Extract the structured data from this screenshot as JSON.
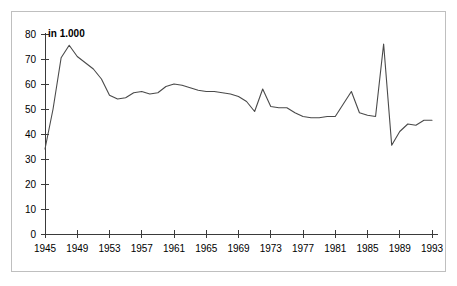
{
  "chart_data": {
    "type": "line",
    "title": "",
    "subtitle": "",
    "unit_label": "in 1.000",
    "xlabel": "",
    "ylabel": "",
    "xlim": [
      1945,
      1993
    ],
    "ylim": [
      0,
      80
    ],
    "y_ticks": [
      0,
      10,
      20,
      30,
      40,
      50,
      60,
      70,
      80
    ],
    "x_ticks": [
      1945,
      1949,
      1953,
      1957,
      1961,
      1965,
      1969,
      1973,
      1977,
      1981,
      1985,
      1989,
      1993
    ],
    "grid": false,
    "legend": null,
    "legend_position": "none",
    "line_color": "#4a4a4a",
    "axis_color": "#3a3a3a",
    "border_color": "#bfbfbf",
    "background_color": "#ffffff",
    "series": [
      {
        "name": "Wert",
        "x": [
          1945,
          1946,
          1947,
          1948,
          1949,
          1950,
          1951,
          1952,
          1953,
          1954,
          1955,
          1956,
          1957,
          1958,
          1959,
          1960,
          1961,
          1962,
          1963,
          1964,
          1965,
          1966,
          1967,
          1968,
          1969,
          1970,
          1971,
          1972,
          1973,
          1974,
          1975,
          1976,
          1977,
          1978,
          1979,
          1980,
          1981,
          1982,
          1983,
          1984,
          1985,
          1986,
          1987,
          1988,
          1989,
          1990,
          1991,
          1992,
          1993
        ],
        "values": [
          34.0,
          50.0,
          70.5,
          75.5,
          71.0,
          68.5,
          66.0,
          62.0,
          55.5,
          54.0,
          54.5,
          56.5,
          57.0,
          56.0,
          56.5,
          59.0,
          60.0,
          59.5,
          58.5,
          57.5,
          57.0,
          57.0,
          56.5,
          56.0,
          55.0,
          53.0,
          49.0,
          58.0,
          51.0,
          50.5,
          50.5,
          48.5,
          47.0,
          46.5,
          46.5,
          47.0,
          47.0,
          52.0,
          57.0,
          48.5,
          47.5,
          47.0,
          76.0,
          35.5,
          41.0,
          44.0,
          43.5,
          45.5,
          45.5
        ]
      }
    ]
  }
}
